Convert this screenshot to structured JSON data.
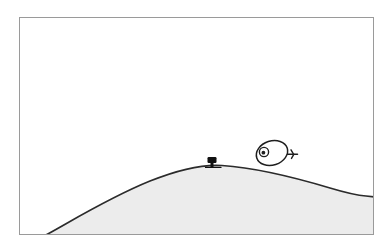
{
  "panel": {
    "title": "Cartoon panel: creature on hilltop",
    "kind": "line-art-illustration",
    "canvas": {
      "width": 392,
      "height": 252,
      "background_color": "#ffffff"
    },
    "frame": {
      "name": "panel-border",
      "x": 19,
      "y": 17,
      "width": 355,
      "height": 218,
      "stroke_color": "#9a9a9a",
      "stroke_width": 1,
      "fill_color": "#ffffff"
    }
  },
  "scene": {
    "sky": {
      "label": "sky",
      "fill_color": "#ffffff"
    },
    "hill": {
      "label": "hill",
      "fill_color": "#ececec",
      "stroke_color": "#2b2b2b",
      "stroke_width": 1.7,
      "apex_x": 222,
      "apex_y": 166,
      "left_base_x": 45,
      "left_base_y": 235,
      "right_edge_x": 374,
      "right_edge_y": 196
    },
    "creature": {
      "label": "creature",
      "body_center_x": 272,
      "body_center_y": 153,
      "body_rx": 16,
      "body_ry": 12,
      "body_rotation_deg": -18,
      "fill_color": "#ffffff",
      "stroke_color": "#1f1f1f",
      "stroke_width": 1.5,
      "eye": {
        "label": "eye",
        "cx": 264,
        "cy": 152,
        "outer_r": 4.6,
        "pupil_r": 1.9,
        "pupil_color": "#1f1f1f"
      },
      "tail": {
        "label": "tail",
        "x1": 288,
        "y1": 154,
        "x2": 298,
        "y2": 154,
        "prong_upper_y": 150,
        "prong_lower_y": 158
      }
    },
    "small_object": {
      "label": "small-dark-object",
      "x": 212,
      "y": 163,
      "width": 9,
      "height": 6,
      "stem_width": 3,
      "stem_height": 4,
      "fill_color": "#111111"
    }
  },
  "palette": {
    "ink": "#1f1f1f",
    "hill_line": "#2b2b2b",
    "hill_fill": "#ececec",
    "frame_line": "#9a9a9a",
    "paper": "#ffffff"
  }
}
